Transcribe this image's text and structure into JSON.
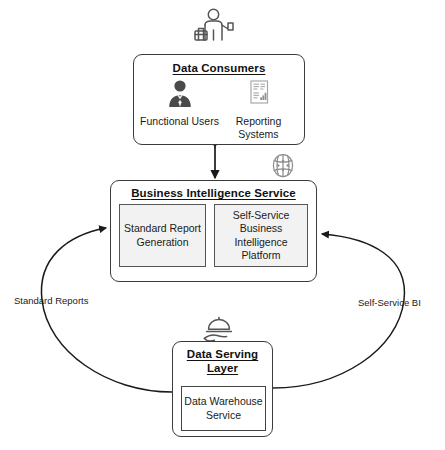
{
  "diagram": {
    "nodes": {
      "consumers": {
        "title": "Data Consumers",
        "items": [
          {
            "label": "Functional Users",
            "icon": "user-tie-icon"
          },
          {
            "label": "Reporting Systems",
            "icon": "report-document-icon"
          }
        ],
        "top_icon": "business-person-icon"
      },
      "bi_service": {
        "title": "Business Intelligence Service",
        "components": [
          {
            "label": "Standard Report Generation"
          },
          {
            "label": "Self-Service Business Intelligence Platform"
          }
        ],
        "side_icon": "brain-network-icon"
      },
      "serving_layer": {
        "title": "Data Serving Layer",
        "components": [
          {
            "label": "Data Warehouse Service"
          }
        ],
        "top_icon": "serving-tray-icon"
      }
    },
    "edges": {
      "consumers_bi": {
        "label": "",
        "style": "double-arrow-vertical"
      },
      "left_curve": {
        "label": "Standard Reports",
        "direction": "serving-layer-to-bi-service"
      },
      "right_curve": {
        "label": "Self-Service BI",
        "direction": "serving-layer-to-bi-service"
      }
    },
    "colors": {
      "stroke": "#3b3b3b",
      "inner_fill": "#f2f2f2",
      "text": "#1a1a1a",
      "icon_dark": "#3f3f3f",
      "icon_light": "#9a9a9a",
      "background": "#ffffff"
    }
  }
}
